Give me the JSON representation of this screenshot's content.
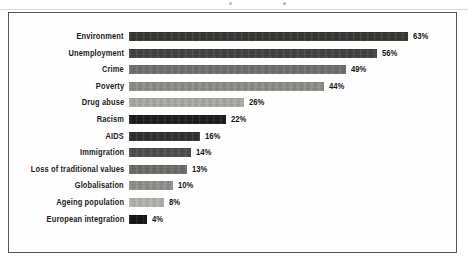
{
  "frame": {
    "border_color": "#54565a",
    "background": "#fefefe"
  },
  "chart_data": {
    "type": "bar",
    "orientation": "horizontal",
    "title": "",
    "subtitle": "",
    "xlabel": "",
    "ylabel": "",
    "grid": false,
    "legend": "none",
    "value_suffix": "%",
    "xlim": [
      0,
      70
    ],
    "axis_visible": false,
    "tick_labels": [],
    "categories": [
      "Environment",
      "Unemployment",
      "Crime",
      "Poverty",
      "Drug abuse",
      "Racism",
      "AIDS",
      "Immigration",
      "Loss of traditional values",
      "Globalisation",
      "Ageing population",
      "European integration"
    ],
    "values": [
      63,
      56,
      49,
      44,
      26,
      22,
      16,
      14,
      13,
      10,
      8,
      4
    ],
    "value_labels": [
      "63%",
      "56%",
      "49%",
      "44%",
      "26%",
      "22%",
      "16%",
      "14%",
      "13%",
      "10%",
      "8%",
      "4%"
    ],
    "bar_colors": [
      "#32322f",
      "#3f3f3d",
      "#6e6e6c",
      "#8d8d8a",
      "#aaaaa6",
      "#17171a",
      "#2b2b2c",
      "#4a4a48",
      "#6a6a67",
      "#8f8f8c",
      "#b4b4b0",
      "#0f0f12"
    ]
  },
  "bars": [
    {
      "label": "Environment",
      "value_label": "63%",
      "value": 63,
      "color": "#32322f"
    },
    {
      "label": "Unemployment",
      "value_label": "56%",
      "value": 56,
      "color": "#3f3f3d"
    },
    {
      "label": "Crime",
      "value_label": "49%",
      "value": 49,
      "color": "#6e6e6c"
    },
    {
      "label": "Poverty",
      "value_label": "44%",
      "value": 44,
      "color": "#8d8d8a"
    },
    {
      "label": "Drug abuse",
      "value_label": "26%",
      "value": 26,
      "color": "#aaaaa6"
    },
    {
      "label": "Racism",
      "value_label": "22%",
      "value": 22,
      "color": "#17171a"
    },
    {
      "label": "AIDS",
      "value_label": "16%",
      "value": 16,
      "color": "#2b2b2c"
    },
    {
      "label": "Immigration",
      "value_label": "14%",
      "value": 14,
      "color": "#4a4a48"
    },
    {
      "label": "Loss of traditional values",
      "value_label": "13%",
      "value": 13,
      "color": "#6a6a67"
    },
    {
      "label": "Globalisation",
      "value_label": "10%",
      "value": 10,
      "color": "#8f8f8c"
    },
    {
      "label": "Ageing population",
      "value_label": "8%",
      "value": 8,
      "color": "#b4b4b0"
    },
    {
      "label": "European integration",
      "value_label": "4%",
      "value": 4,
      "color": "#0f0f12"
    }
  ]
}
